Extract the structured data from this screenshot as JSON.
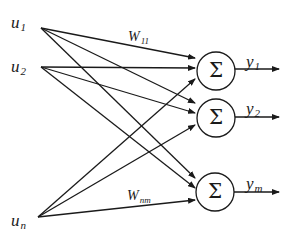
{
  "diagram": {
    "colors": {
      "stroke": "#1a1a1a",
      "background": "#ffffff"
    },
    "inputs": [
      {
        "id": "u1",
        "base": "u",
        "sub": "1",
        "x": 41,
        "y": 28
      },
      {
        "id": "u2",
        "base": "u",
        "sub": "2",
        "x": 41,
        "y": 67
      },
      {
        "id": "un",
        "base": "u",
        "sub": "n",
        "x": 38,
        "y": 217
      }
    ],
    "neurons": [
      {
        "id": "n1",
        "symbol": "Σ",
        "cx": 216,
        "cy": 71,
        "r": 19
      },
      {
        "id": "n2",
        "symbol": "Σ",
        "cx": 216,
        "cy": 118,
        "r": 19
      },
      {
        "id": "nm",
        "symbol": "Σ",
        "cx": 215,
        "cy": 192,
        "r": 19
      }
    ],
    "outputs": [
      {
        "id": "y1",
        "base": "y",
        "sub": "1"
      },
      {
        "id": "y2",
        "base": "y",
        "sub": "2"
      },
      {
        "id": "ym",
        "base": "y",
        "sub": "m"
      }
    ],
    "weights": [
      {
        "id": "w11",
        "base": "W",
        "sub": "11"
      },
      {
        "id": "wnm",
        "base": "W",
        "sub": "nm"
      }
    ]
  }
}
